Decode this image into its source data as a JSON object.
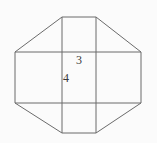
{
  "figure": {
    "name": "octagon-with-inscribed-grid",
    "background_color": "#fbfbfb",
    "stroke_color": "#6b6b6b",
    "label_color": "#3a3a3a",
    "stroke_width": 1,
    "outline": {
      "shape": "octagon",
      "vertices": [
        [
          62,
          17
        ],
        [
          96,
          17
        ],
        [
          141,
          52
        ],
        [
          141,
          103
        ],
        [
          96,
          133
        ],
        [
          62,
          133
        ],
        [
          15,
          103
        ],
        [
          15,
          52
        ]
      ]
    },
    "grid_lines": {
      "vertical_x": [
        62,
        96
      ],
      "vertical_y_range": [
        17,
        133
      ],
      "horizontal_y": [
        52,
        103
      ],
      "horizontal_x_range": [
        15,
        141
      ]
    },
    "labels": [
      {
        "text": "3",
        "x": 79,
        "y": 64,
        "meaning": "center-square-width"
      },
      {
        "text": "4",
        "x": 66,
        "y": 82,
        "meaning": "center-square-height"
      }
    ]
  }
}
